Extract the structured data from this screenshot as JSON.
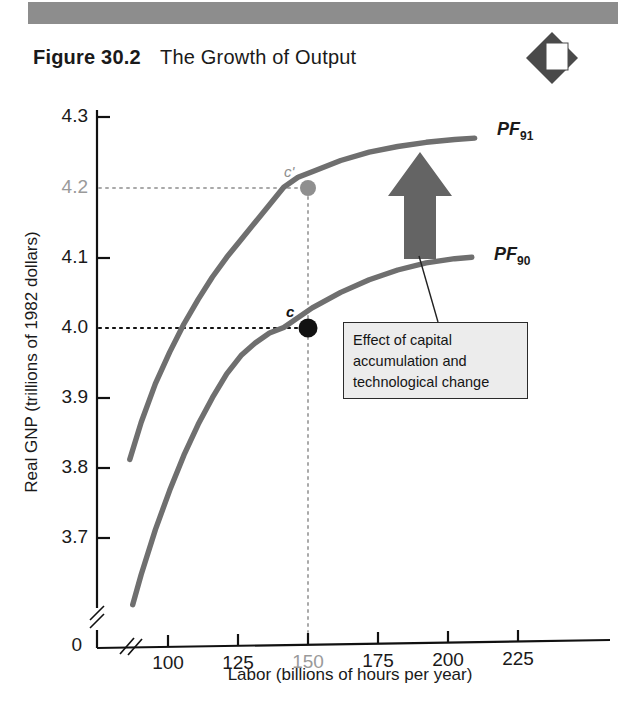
{
  "header": {
    "figure_number": "Figure 30.2",
    "caption": "The Growth of Output",
    "badge_icon": "diamond-badge-icon",
    "bar_color": "#8d8d8d"
  },
  "callout": {
    "line1": "Effect of capital",
    "line2": "accumulation and",
    "line3": "technological change"
  },
  "annotations": {
    "arrow_icon": "up-arrow-shift-icon",
    "point_c_label": "c",
    "point_c_prime_label": "c'"
  },
  "chart_data": {
    "type": "line",
    "title": "The Growth of Output",
    "xlabel": "Labor (billions of hours per year)",
    "ylabel": "Real GNP (trillions of 1982 dollars)",
    "xlim": [
      88,
      232
    ],
    "ylim": [
      3.65,
      4.32
    ],
    "xticks": [
      100,
      125,
      150,
      175,
      200,
      225
    ],
    "xtick_labels": [
      "100",
      "125",
      "150",
      "175",
      "200",
      "225"
    ],
    "yticks": [
      4.3,
      4.2,
      4.1,
      4.0,
      3.9,
      3.8,
      3.7
    ],
    "ytick_labels": [
      "4.3",
      "4.2",
      "4.1",
      "4.0",
      "3.9",
      "3.8",
      "3.7"
    ],
    "origin_label": "0",
    "axis_break": true,
    "grid": false,
    "highlight_xtick": "150",
    "highlight_ytick": "4.2",
    "curve_color": "#6f6f6f",
    "series": [
      {
        "name": "PF91",
        "label": "PF",
        "label_sub": "91",
        "points": [
          [
            96,
            3.812
          ],
          [
            100,
            3.865
          ],
          [
            105,
            3.92
          ],
          [
            110,
            3.965
          ],
          [
            115,
            4.005
          ],
          [
            120,
            4.04
          ],
          [
            125,
            4.072
          ],
          [
            130,
            4.1
          ],
          [
            135,
            4.125
          ],
          [
            140,
            4.15
          ],
          [
            145,
            4.175
          ],
          [
            150,
            4.2
          ],
          [
            155,
            4.214
          ],
          [
            160,
            4.222
          ],
          [
            170,
            4.238
          ],
          [
            180,
            4.25
          ],
          [
            190,
            4.258
          ],
          [
            200,
            4.264
          ],
          [
            210,
            4.268
          ],
          [
            217,
            4.27
          ]
        ]
      },
      {
        "name": "PF90",
        "label": "PF",
        "label_sub": "90",
        "points": [
          [
            97,
            3.605
          ],
          [
            100,
            3.648
          ],
          [
            105,
            3.712
          ],
          [
            110,
            3.768
          ],
          [
            115,
            3.818
          ],
          [
            120,
            3.862
          ],
          [
            125,
            3.9
          ],
          [
            130,
            3.934
          ],
          [
            135,
            3.96
          ],
          [
            140,
            3.978
          ],
          [
            145,
            3.992
          ],
          [
            150,
            4.0
          ],
          [
            160,
            4.028
          ],
          [
            170,
            4.05
          ],
          [
            180,
            4.068
          ],
          [
            190,
            4.082
          ],
          [
            200,
            4.092
          ],
          [
            210,
            4.098
          ],
          [
            216,
            4.1
          ]
        ]
      }
    ],
    "marked_points": [
      {
        "name": "c",
        "x": 150,
        "y": 4.0,
        "color": "#111111",
        "guide_color": "#111111"
      },
      {
        "name": "c'",
        "x": 150,
        "y": 4.2,
        "color": "#8f8f8f",
        "guide_color": "#a9a9a9"
      }
    ],
    "shift_arrow": {
      "x": 187,
      "y_from": 4.1,
      "y_to": 4.245,
      "color": "#6a6a6a"
    }
  }
}
